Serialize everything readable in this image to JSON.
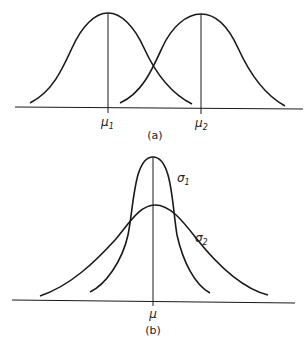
{
  "figure": {
    "panel_a": {
      "caption": "(a)",
      "mean_labels": [
        {
          "symbol": "μ",
          "subscript": "1"
        },
        {
          "symbol": "μ",
          "subscript": "2"
        }
      ],
      "description": "Two normal distributions with equal variance and different means"
    },
    "panel_b": {
      "caption": "(b)",
      "mean_label": {
        "symbol": "μ"
      },
      "sd_labels": [
        {
          "symbol": "σ",
          "subscript": "1"
        },
        {
          "symbol": "σ",
          "subscript": "2"
        }
      ],
      "description": "Two normal distributions with equal mean and different standard deviations"
    },
    "colors": {
      "stroke": "#1a1a1a",
      "background": "#ffffff"
    }
  }
}
